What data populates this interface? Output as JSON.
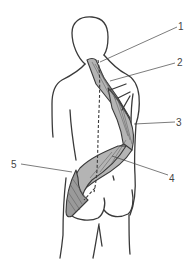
{
  "figure": {
    "colors": {
      "outline": "#3a3a3a",
      "muscle_fill": "#b4b4b4",
      "muscle_shadow": "#9a9a9a",
      "background": "#ffffff"
    },
    "labels": [
      {
        "id": "1",
        "text": "1",
        "x": 182,
        "y": 28
      },
      {
        "id": "2",
        "text": "2",
        "x": 180,
        "y": 66
      },
      {
        "id": "3",
        "text": "3",
        "x": 179,
        "y": 126
      },
      {
        "id": "4",
        "text": "4",
        "x": 172,
        "y": 178
      },
      {
        "id": "5",
        "text": "5",
        "x": 13,
        "y": 167
      }
    ]
  }
}
